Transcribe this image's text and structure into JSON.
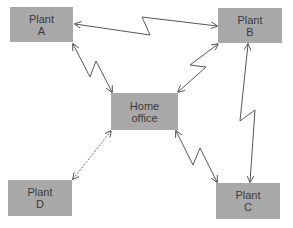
{
  "diagram": {
    "nodes": [
      {
        "id": "plant-a",
        "line1": "Plant",
        "line2": "A"
      },
      {
        "id": "plant-b",
        "line1": "Plant",
        "line2": "B"
      },
      {
        "id": "home-office",
        "line1": "Home",
        "line2": "office"
      },
      {
        "id": "plant-c",
        "line1": "Plant",
        "line2": "C"
      },
      {
        "id": "plant-d",
        "line1": "Plant",
        "line2": "D"
      }
    ],
    "links": [
      {
        "from": "plant-a",
        "to": "plant-b",
        "style": "zigzag",
        "bidirectional": true
      },
      {
        "from": "plant-a",
        "to": "home-office",
        "style": "zigzag",
        "bidirectional": true
      },
      {
        "from": "home-office",
        "to": "plant-b",
        "style": "zigzag",
        "bidirectional": true
      },
      {
        "from": "home-office",
        "to": "plant-c",
        "style": "zigzag",
        "bidirectional": true
      },
      {
        "from": "plant-b",
        "to": "plant-c",
        "style": "zigzag",
        "bidirectional": true
      },
      {
        "from": "home-office",
        "to": "plant-d",
        "style": "dashed",
        "bidirectional": true
      }
    ],
    "colors": {
      "node_fill": "#a9a9a9",
      "node_text": "#3a3a3a",
      "link": "#444444"
    }
  }
}
